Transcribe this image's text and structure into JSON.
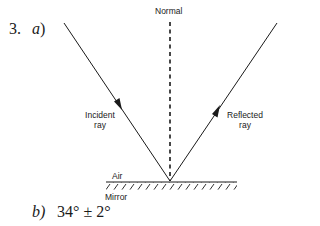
{
  "question": {
    "number": "3.",
    "part_a_label": "a",
    "part_a_paren": ")",
    "part_b_label": "b)",
    "part_b_answer": "34°  ± 2°"
  },
  "diagram": {
    "labels": {
      "normal": "Normal",
      "incident_line1": "Incident",
      "incident_line2": "ray",
      "reflected_line1": "Reflected",
      "reflected_line2": "ray",
      "air": "Air",
      "mirror": "Mirror"
    },
    "colors": {
      "line": "#1a1a1a",
      "background": "#ffffff"
    },
    "geometry": {
      "point_of_incidence": [
        170,
        181
      ],
      "incident_start": [
        64,
        23
      ],
      "reflected_end": [
        277,
        23
      ],
      "normal_top": [
        170,
        22
      ],
      "mirror_left_x": 106,
      "mirror_right_x": 237,
      "mirror_y": 182
    }
  }
}
